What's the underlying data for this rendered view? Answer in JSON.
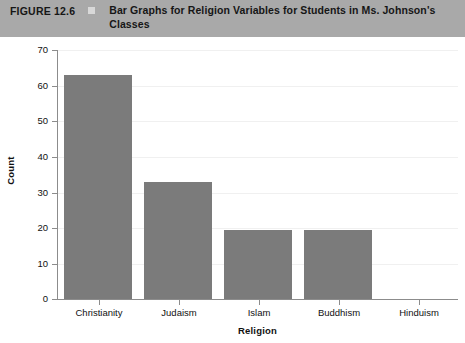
{
  "figure": {
    "number": "FIGURE 12.6",
    "marker": "square-marker",
    "caption": "Bar Graphs for Religion Variables for Students in Ms. Johnson's Classes"
  },
  "colors": {
    "header_background": "#a9a9a9",
    "bar_fill": "#7b7b7b",
    "axis": "#8c8c8c",
    "gridline": "#f0f0f0",
    "plot_background": "#ffffff"
  },
  "chart_data": {
    "type": "bar",
    "title": "",
    "categories": [
      "Christianity",
      "Judaism",
      "Islam",
      "Buddhism",
      "Hinduism"
    ],
    "values": [
      63,
      33,
      19.5,
      19.5,
      0
    ],
    "series": [
      {
        "name": "Count",
        "values": [
          63,
          33,
          19.5,
          19.5,
          0
        ]
      }
    ],
    "xlabel": "Religion",
    "ylabel": "Count",
    "ylim": [
      0,
      70
    ],
    "ytick_values": [
      0,
      10,
      20,
      30,
      40,
      50,
      60,
      70
    ],
    "ytick_labels": [
      "0",
      "10",
      "20",
      "30",
      "40",
      "50",
      "60",
      "70"
    ],
    "grid": true,
    "legend": "none"
  }
}
